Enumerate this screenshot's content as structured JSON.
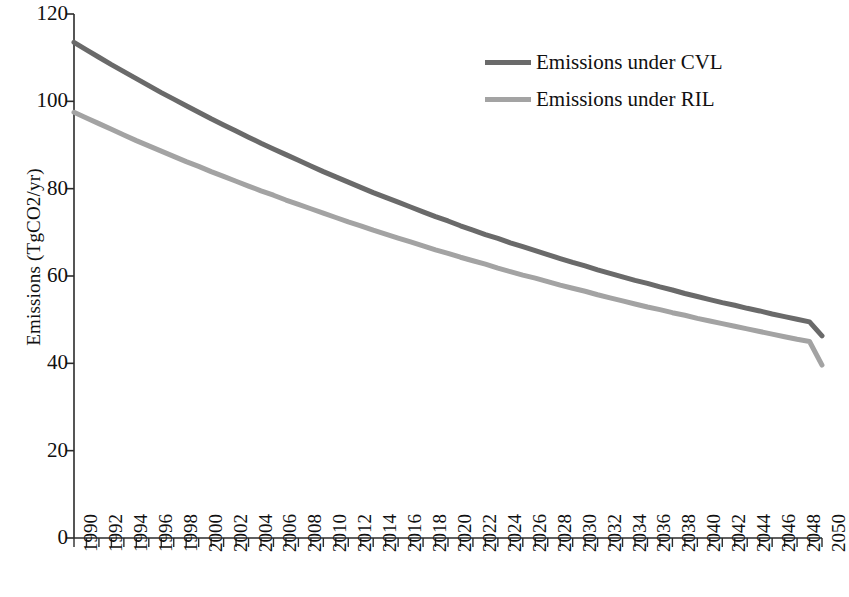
{
  "chart_data": {
    "type": "line",
    "title": "",
    "subtitle": "",
    "xlabel": "",
    "ylabel": "Emissions (TgCO2/yr)",
    "xlim": [
      1990,
      2050
    ],
    "ylim": [
      0,
      120
    ],
    "yticks": [
      0,
      20,
      40,
      60,
      80,
      100,
      120
    ],
    "ytick_labels": [
      "0",
      "20",
      "40",
      "60",
      "80",
      "100",
      "120"
    ],
    "xticks": [
      1990,
      1992,
      1994,
      1996,
      1998,
      2000,
      2002,
      2004,
      2006,
      2008,
      2010,
      2012,
      2014,
      2016,
      2018,
      2020,
      2022,
      2024,
      2026,
      2028,
      2030,
      2032,
      2034,
      2036,
      2038,
      2040,
      2042,
      2044,
      2046,
      2048,
      2050
    ],
    "xtick_labels": [
      "1990",
      "1992",
      "1994",
      "1996",
      "1998",
      "2000",
      "2002",
      "2004",
      "2006",
      "2008",
      "2010",
      "2012",
      "2014",
      "2016",
      "2018",
      "2020",
      "2022",
      "2024",
      "2026",
      "2028",
      "2030",
      "2032",
      "2034",
      "2036",
      "2038",
      "2040",
      "2042",
      "2044",
      "2046",
      "2048",
      "2050"
    ],
    "xtick_minor_step": 1,
    "grid": false,
    "legend_position": "top-right",
    "x": [
      1990,
      1991,
      1992,
      1993,
      1994,
      1995,
      1996,
      1997,
      1998,
      1999,
      2000,
      2001,
      2002,
      2003,
      2004,
      2005,
      2006,
      2007,
      2008,
      2009,
      2010,
      2011,
      2012,
      2013,
      2014,
      2015,
      2016,
      2017,
      2018,
      2019,
      2020,
      2021,
      2022,
      2023,
      2024,
      2025,
      2026,
      2027,
      2028,
      2029,
      2030,
      2031,
      2032,
      2033,
      2034,
      2035,
      2036,
      2037,
      2038,
      2039,
      2040,
      2041,
      2042,
      2043,
      2044,
      2045,
      2046,
      2047,
      2048,
      2049,
      2050
    ],
    "series": [
      {
        "name": "Emissions under CVL",
        "color": "#6a6a6a",
        "values": [
          113.5,
          111.8,
          110.1,
          108.4,
          106.8,
          105.2,
          103.6,
          102.0,
          100.5,
          99.0,
          97.5,
          96.0,
          94.6,
          93.2,
          91.8,
          90.4,
          89.1,
          87.8,
          86.5,
          85.2,
          83.9,
          82.7,
          81.5,
          80.3,
          79.1,
          78.0,
          76.9,
          75.8,
          74.7,
          73.6,
          72.6,
          71.5,
          70.5,
          69.5,
          68.6,
          67.6,
          66.7,
          65.8,
          64.9,
          64.0,
          63.1,
          62.3,
          61.4,
          60.6,
          59.8,
          59.0,
          58.3,
          57.5,
          56.8,
          56.0,
          55.3,
          54.6,
          53.9,
          53.3,
          52.6,
          52.0,
          51.3,
          50.7,
          50.1,
          49.5,
          46.3
        ]
      },
      {
        "name": "Emissions under RIL",
        "color": "#a3a3a3",
        "values": [
          97.5,
          96.2,
          94.9,
          93.6,
          92.3,
          91.0,
          89.8,
          88.6,
          87.4,
          86.2,
          85.1,
          83.9,
          82.8,
          81.7,
          80.6,
          79.5,
          78.5,
          77.4,
          76.4,
          75.4,
          74.4,
          73.4,
          72.4,
          71.5,
          70.5,
          69.6,
          68.7,
          67.8,
          66.9,
          66.0,
          65.2,
          64.3,
          63.5,
          62.7,
          61.8,
          61.0,
          60.2,
          59.5,
          58.7,
          57.9,
          57.2,
          56.5,
          55.7,
          55.0,
          54.3,
          53.6,
          52.9,
          52.3,
          51.6,
          51.0,
          50.3,
          49.7,
          49.1,
          48.5,
          47.9,
          47.3,
          46.7,
          46.1,
          45.5,
          45.0,
          39.6
        ]
      }
    ]
  },
  "legend": {
    "items": [
      {
        "label": "Emissions under CVL",
        "color": "#6a6a6a"
      },
      {
        "label": "Emissions under RIL",
        "color": "#a3a3a3"
      }
    ]
  },
  "axes": {
    "y_title": "Emissions (TgCO2/yr)",
    "axis_color": "#2b2b2b"
  }
}
